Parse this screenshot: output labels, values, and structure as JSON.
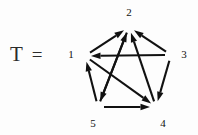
{
  "figure": {
    "label": {
      "variable": "T",
      "operator": "="
    },
    "colors": {
      "ink": "#111111",
      "label_ink": "#2b2b2b",
      "background": "#ffffff"
    },
    "graph": {
      "kind": "directed-graph",
      "description": "tournament digraph on five vertices drawn as a pentagon with pentagram diagonals",
      "nodes": [
        {
          "id": "1",
          "label": "1",
          "x": 85,
          "y": 56,
          "label_x": 71,
          "label_y": 55
        },
        {
          "id": "2",
          "label": "2",
          "x": 129,
          "y": 27,
          "label_x": 129,
          "label_y": 13
        },
        {
          "id": "3",
          "label": "3",
          "x": 171,
          "y": 55,
          "label_x": 184,
          "label_y": 55
        },
        {
          "id": "4",
          "label": "4",
          "x": 156,
          "y": 107,
          "label_x": 163,
          "label_y": 124
        },
        {
          "id": "5",
          "label": "5",
          "x": 98,
          "y": 107,
          "label_x": 93,
          "label_y": 124
        }
      ],
      "edges": [
        {
          "from": "1",
          "to": "2"
        },
        {
          "from": "3",
          "to": "2"
        },
        {
          "from": "3",
          "to": "1"
        },
        {
          "from": "3",
          "to": "4"
        },
        {
          "from": "5",
          "to": "4"
        },
        {
          "from": "5",
          "to": "1"
        },
        {
          "from": "5",
          "to": "2"
        },
        {
          "from": "4",
          "to": "2"
        },
        {
          "from": "1",
          "to": "4"
        },
        {
          "from": "2",
          "to": "5"
        }
      ]
    }
  }
}
